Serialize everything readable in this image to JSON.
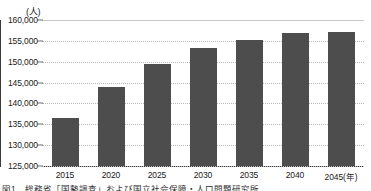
{
  "chart_data": {
    "type": "bar",
    "title": "",
    "subtitle": "",
    "xlabel": "年",
    "ylabel": "",
    "unit_label": "(人)",
    "categories": [
      "2015",
      "2020",
      "2025",
      "2030",
      "2035",
      "2040",
      "2045(年)"
    ],
    "x_values": [
      2015,
      2020,
      2025,
      2030,
      2035,
      2040,
      2045
    ],
    "values": [
      136500,
      143900,
      149400,
      153200,
      155300,
      157000,
      157100
    ],
    "series": [
      {
        "name": "推計人口",
        "values": [
          136500,
          143900,
          149400,
          153200,
          155300,
          157000,
          157100
        ],
        "color": "#4d4d4d"
      }
    ],
    "ylim": [
      125000,
      160000
    ],
    "ytick_values": [
      125000,
      130000,
      135000,
      140000,
      145000,
      150000,
      155000,
      160000
    ],
    "ytick_labels": [
      "125,000",
      "130,000",
      "135,000",
      "140,000",
      "145,000",
      "150,000",
      "155,000",
      "160,000"
    ],
    "grid": true,
    "grid_axis": "y",
    "legend": false,
    "legend_position": "none"
  },
  "axes": {
    "y_unit": "(人)",
    "x_axis_suffix": "(年)"
  },
  "colors": {
    "bar": "#4d4d4d",
    "axis": "#3c3c3c",
    "grid": "#b9b9b9",
    "text": "#1a1a1a",
    "background": "#ffffff"
  },
  "caption": {
    "text": "図1　総務省「国勢調査」および国立社会保障・人口問題研究所"
  }
}
